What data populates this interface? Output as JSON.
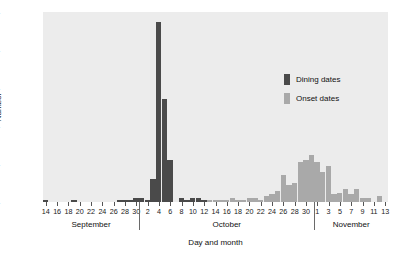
{
  "chart_data": {
    "type": "bar",
    "title": "",
    "subtitle": "",
    "xlabel": "Day and month",
    "ylabel": "Number",
    "ylim": [
      0,
      100
    ],
    "yticks": [
      0,
      20,
      40,
      60,
      80,
      100
    ],
    "grid": false,
    "legend_position": "inside-upper-right",
    "legend": [
      "Dining dates",
      "Onset dates"
    ],
    "months": [
      {
        "name": "September",
        "start_day": 14,
        "end_day": 30
      },
      {
        "name": "October",
        "start_day": 1,
        "end_day": 31
      },
      {
        "name": "November",
        "start_day": 1,
        "end_day": 13
      }
    ],
    "xtick_labels": [
      "14",
      "16",
      "18",
      "20",
      "22",
      "24",
      "26",
      "28",
      "30",
      "2",
      "4",
      "6",
      "8",
      "10",
      "12",
      "14",
      "16",
      "18",
      "20",
      "22",
      "24",
      "26",
      "28",
      "30",
      "1",
      "3",
      "5",
      "7",
      "9",
      "11",
      "13"
    ],
    "categories": [
      "Sep 14",
      "Sep 15",
      "Sep 16",
      "Sep 17",
      "Sep 18",
      "Sep 19",
      "Sep 20",
      "Sep 21",
      "Sep 22",
      "Sep 23",
      "Sep 24",
      "Sep 25",
      "Sep 26",
      "Sep 27",
      "Sep 28",
      "Sep 29",
      "Sep 30",
      "Oct 1",
      "Oct 2",
      "Oct 3",
      "Oct 4",
      "Oct 5",
      "Oct 6",
      "Oct 7",
      "Oct 8",
      "Oct 9",
      "Oct 10",
      "Oct 11",
      "Oct 12",
      "Oct 13",
      "Oct 14",
      "Oct 15",
      "Oct 16",
      "Oct 17",
      "Oct 18",
      "Oct 19",
      "Oct 20",
      "Oct 21",
      "Oct 22",
      "Oct 23",
      "Oct 24",
      "Oct 25",
      "Oct 26",
      "Oct 27",
      "Oct 28",
      "Oct 29",
      "Oct 30",
      "Oct 31",
      "Nov 1",
      "Nov 2",
      "Nov 3",
      "Nov 4",
      "Nov 5",
      "Nov 6",
      "Nov 7",
      "Nov 8",
      "Nov 9",
      "Nov 10",
      "Nov 11",
      "Nov 12",
      "Nov 13"
    ],
    "series": [
      {
        "name": "Dining dates",
        "color": "#4a4a4a",
        "values": [
          1,
          0,
          0,
          0,
          0,
          1,
          0,
          0,
          0,
          0,
          0,
          0,
          0,
          1,
          1,
          1,
          2,
          2,
          1,
          12,
          95,
          54,
          22,
          0,
          2,
          1,
          2,
          2,
          1,
          0,
          0,
          0,
          0,
          0,
          0,
          0,
          0,
          0,
          0,
          0,
          0,
          0,
          0,
          0,
          0,
          0,
          0,
          0,
          0,
          0,
          0,
          0,
          0,
          0,
          0,
          0,
          0,
          0,
          0,
          0,
          0
        ]
      },
      {
        "name": "Onset dates",
        "color": "#a9a9a9",
        "values": [
          0,
          0,
          0,
          0,
          0,
          0,
          0,
          0,
          0,
          0,
          0,
          0,
          0,
          0,
          0,
          0,
          0,
          0,
          0,
          0,
          0,
          0,
          0,
          0,
          0,
          0,
          0,
          0,
          0,
          1,
          1,
          1,
          1,
          2,
          1,
          1,
          2,
          2,
          1,
          3,
          4,
          6,
          14,
          9,
          10,
          21,
          22,
          25,
          21,
          16,
          19,
          4,
          5,
          7,
          4,
          7,
          2,
          2,
          0,
          3,
          0
        ]
      }
    ],
    "peak_annotations": {
      "dining_peak_day": "Oct 4",
      "dining_peak_value": 95,
      "onset_peak_day": "Oct 31",
      "onset_peak_value": 25
    }
  },
  "colors": {
    "plot_background": "#ececec",
    "page_background": "#ffffff",
    "dining": "#4a4a4a",
    "onset": "#a9a9a9",
    "axis_text": "#1a1a1a"
  }
}
